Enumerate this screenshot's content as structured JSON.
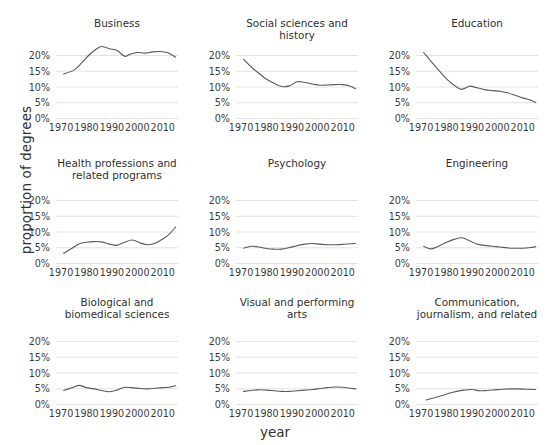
{
  "chart_data": {
    "type": "line",
    "title": "",
    "xlabel": "year",
    "ylabel": "proportion of degrees",
    "xlim": [
      1968,
      2016
    ],
    "ylim": [
      0,
      0.235
    ],
    "grid": true,
    "legend": "none",
    "layout": "small-multiples 3x3",
    "yticks": [
      "0%",
      "5%",
      "10%",
      "15%",
      "20%"
    ],
    "ytick_values": [
      0,
      5,
      10,
      15,
      20
    ],
    "xticks": [
      "1970",
      "1980",
      "1990",
      "2000",
      "2010"
    ],
    "xtick_values": [
      1970,
      1980,
      1990,
      2000,
      2010
    ],
    "line_color": "#5a5a5a",
    "grid_color": "#e2e2e2",
    "panels": [
      {
        "title": "Business",
        "x": [
          1971,
          1975,
          1978,
          1981,
          1984,
          1986,
          1989,
          1992,
          1995,
          1997,
          2000,
          2003,
          2006,
          2009,
          2012,
          2015
        ],
        "y": [
          14.0,
          15.2,
          17.4,
          20.0,
          22.0,
          22.7,
          22.0,
          21.4,
          19.6,
          20.2,
          20.8,
          20.6,
          21.0,
          21.1,
          20.7,
          19.3
        ]
      },
      {
        "title": "Social sciences and\nhistory",
        "x": [
          1971,
          1974,
          1977,
          1980,
          1983,
          1986,
          1989,
          1992,
          1995,
          1998,
          2001,
          2004,
          2007,
          2010,
          2013,
          2015
        ],
        "y": [
          18.6,
          16.2,
          14.2,
          12.3,
          11.0,
          10.0,
          10.2,
          11.5,
          11.3,
          10.8,
          10.4,
          10.5,
          10.6,
          10.6,
          10.1,
          9.3
        ]
      },
      {
        "title": "Education",
        "x": [
          1971,
          1974,
          1977,
          1980,
          1983,
          1986,
          1989,
          1992,
          1995,
          1998,
          2001,
          2004,
          2007,
          2010,
          2013,
          2015
        ],
        "y": [
          20.8,
          17.9,
          15.1,
          12.4,
          10.4,
          9.1,
          10.1,
          9.6,
          9.0,
          8.7,
          8.5,
          8.0,
          7.2,
          6.4,
          5.7,
          4.9
        ]
      },
      {
        "title": "Health professions and\nrelated programs",
        "x": [
          1971,
          1974,
          1977,
          1980,
          1983,
          1986,
          1989,
          1992,
          1995,
          1998,
          2001,
          2004,
          2007,
          2010,
          2013,
          2015
        ],
        "y": [
          3.1,
          4.5,
          6.0,
          6.6,
          6.8,
          6.7,
          6.0,
          5.6,
          6.6,
          7.3,
          6.4,
          5.8,
          6.3,
          7.6,
          9.5,
          11.4
        ]
      },
      {
        "title": "Psychology",
        "x": [
          1971,
          1974,
          1977,
          1980,
          1983,
          1986,
          1989,
          1992,
          1995,
          1998,
          2001,
          2004,
          2007,
          2010,
          2013,
          2015
        ],
        "y": [
          4.7,
          5.3,
          5.1,
          4.6,
          4.4,
          4.4,
          4.9,
          5.5,
          6.0,
          6.2,
          6.0,
          5.8,
          5.8,
          5.9,
          6.1,
          6.2
        ]
      },
      {
        "title": "Engineering",
        "x": [
          1971,
          1974,
          1977,
          1980,
          1983,
          1986,
          1989,
          1992,
          1995,
          1998,
          2001,
          2004,
          2007,
          2010,
          2013,
          2015
        ],
        "y": [
          5.3,
          4.5,
          5.4,
          6.6,
          7.5,
          8.0,
          7.1,
          6.0,
          5.6,
          5.3,
          5.1,
          4.8,
          4.7,
          4.7,
          4.9,
          5.2
        ]
      },
      {
        "title": "Biological and\nbiomedical sciences",
        "x": [
          1971,
          1974,
          1977,
          1980,
          1983,
          1986,
          1989,
          1992,
          1995,
          1998,
          2001,
          2004,
          2007,
          2010,
          2013,
          2015
        ],
        "y": [
          4.3,
          5.1,
          5.9,
          5.2,
          4.8,
          4.3,
          3.9,
          4.4,
          5.3,
          5.2,
          4.9,
          4.8,
          5.0,
          5.2,
          5.4,
          5.8
        ]
      },
      {
        "title": "Visual and performing\narts",
        "x": [
          1971,
          1974,
          1977,
          1980,
          1983,
          1986,
          1989,
          1992,
          1995,
          1998,
          2001,
          2004,
          2007,
          2010,
          2013,
          2015
        ],
        "y": [
          4.0,
          4.3,
          4.5,
          4.4,
          4.2,
          4.0,
          4.0,
          4.2,
          4.4,
          4.6,
          4.9,
          5.2,
          5.4,
          5.3,
          5.0,
          4.8
        ]
      },
      {
        "title": "Communication,\njournalism, and related",
        "x": [
          1972,
          1975,
          1978,
          1981,
          1984,
          1987,
          1990,
          1993,
          1996,
          1999,
          2002,
          2005,
          2008,
          2011,
          2014,
          2015
        ],
        "y": [
          1.3,
          1.9,
          2.6,
          3.4,
          4.0,
          4.4,
          4.6,
          4.2,
          4.3,
          4.5,
          4.7,
          4.8,
          4.8,
          4.7,
          4.6,
          4.6
        ]
      }
    ]
  }
}
